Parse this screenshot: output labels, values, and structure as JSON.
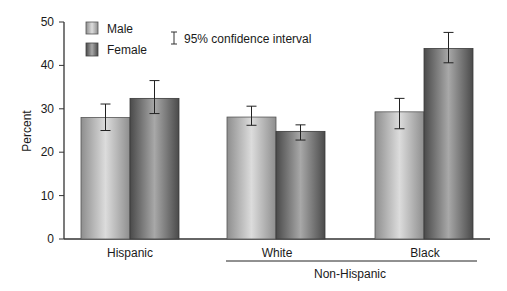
{
  "chart_data": {
    "type": "bar",
    "title": "",
    "xlabel": "",
    "ylabel": "Percent",
    "ylim": [
      0,
      50
    ],
    "yticks": [
      0,
      10,
      20,
      30,
      40,
      50
    ],
    "grid": false,
    "legend_position": "top-left",
    "categories": [
      "Hispanic",
      "White",
      "Black"
    ],
    "category_group": {
      "label": "Non-Hispanic",
      "members": [
        "White",
        "Black"
      ]
    },
    "series": [
      {
        "name": "Male",
        "color": "#b8b8b8",
        "values": [
          28.0,
          28.1,
          29.3
        ],
        "ci_low": [
          25.0,
          26.2,
          25.4
        ],
        "ci_high": [
          31.1,
          30.6,
          32.4
        ]
      },
      {
        "name": "Female",
        "color": "#7a7a7a",
        "values": [
          32.4,
          24.8,
          43.9
        ],
        "ci_low": [
          28.9,
          22.8,
          40.6
        ],
        "ci_high": [
          36.5,
          26.3,
          47.6
        ]
      }
    ],
    "annotations": [
      "95% confidence interval"
    ]
  },
  "legend": {
    "male": "Male",
    "female": "Female",
    "ci": "95% confidence interval"
  },
  "axis": {
    "ylabel": "Percent",
    "ticks": [
      "0",
      "10",
      "20",
      "30",
      "40",
      "50"
    ],
    "categories": [
      "Hispanic",
      "White",
      "Black"
    ],
    "group_label": "Non-Hispanic"
  }
}
